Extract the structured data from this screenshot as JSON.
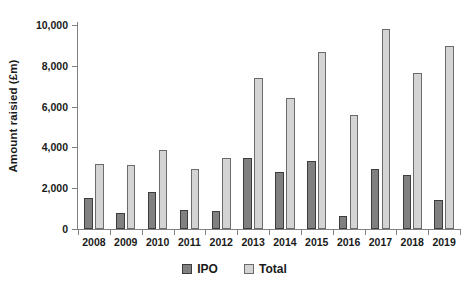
{
  "chart_data": {
    "type": "bar",
    "title": "",
    "subtitle": "",
    "xlabel": "",
    "ylabel": "Amount raisied (£m)",
    "ylim": [
      0,
      10000
    ],
    "ytick_interval": 2000,
    "ytick_labels": [
      "0",
      "2,000",
      "4,000",
      "6,000",
      "8,000",
      "10,000"
    ],
    "ytick_values": [
      0,
      2000,
      4000,
      6000,
      8000,
      10000
    ],
    "grid": false,
    "legend_position": "bottom",
    "categories": [
      "2008",
      "2009",
      "2010",
      "2011",
      "2012",
      "2013",
      "2014",
      "2015",
      "2016",
      "2017",
      "2018",
      "2019"
    ],
    "series": [
      {
        "name": "IPO",
        "color": "#808080",
        "values": [
          1500,
          800,
          1800,
          950,
          900,
          3470,
          2790,
          3320,
          650,
          2940,
          2650,
          1400
        ]
      },
      {
        "name": "Total",
        "color": "#d4d4d4",
        "values": [
          3180,
          3120,
          3880,
          2950,
          3470,
          7420,
          6410,
          8670,
          5580,
          9820,
          7660,
          8970
        ]
      }
    ]
  },
  "legend": {
    "items": [
      {
        "label": "IPO",
        "swatch": "ipo"
      },
      {
        "label": "Total",
        "swatch": "total"
      }
    ]
  },
  "colors": {
    "ipo": "#808080",
    "total": "#d4d4d4",
    "axis": "#808080",
    "text": "#1a1a1a",
    "background": "#ffffff"
  }
}
